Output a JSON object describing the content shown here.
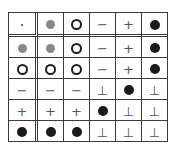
{
  "table": {
    "description": "6x6 operation table with header row and header column separated by double lines",
    "symbols": {
      "dot": {
        "icon": "small-dot-icon",
        "glyph": "·"
      },
      "gray": {
        "icon": "gray-filled-circle-icon",
        "color": "#8a8a8a"
      },
      "ring": {
        "icon": "open-circle-icon",
        "color": "#1e1e1e"
      },
      "minus": {
        "icon": "minus-icon",
        "glyph": "−"
      },
      "plus": {
        "icon": "plus-icon",
        "glyph": "+"
      },
      "black": {
        "icon": "black-filled-circle-icon",
        "color": "#1a1a1a"
      },
      "bottom": {
        "icon": "up-tack-icon",
        "glyph": "⊥"
      }
    },
    "rows": [
      [
        "dot",
        "gray",
        "ring",
        "minus",
        "plus",
        "black"
      ],
      [
        "gray",
        "gray",
        "ring",
        "minus",
        "plus",
        "black"
      ],
      [
        "ring",
        "ring",
        "ring",
        "minus",
        "plus",
        "black"
      ],
      [
        "minus",
        "minus",
        "minus",
        "bottom",
        "black",
        "bottom"
      ],
      [
        "plus",
        "plus",
        "plus",
        "black",
        "bottom",
        "bottom"
      ],
      [
        "black",
        "black",
        "black",
        "bottom",
        "bottom",
        "bottom"
      ]
    ]
  }
}
